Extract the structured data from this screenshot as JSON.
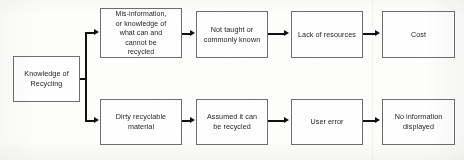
{
  "diagram": {
    "background_color": "#fdfdfc",
    "box_border_color": "#6e6e70",
    "connector_color": "#111111",
    "root": {
      "label": "Knowledge of\nRecycling"
    },
    "branches": [
      {
        "name": "upper-branch",
        "steps": [
          {
            "label": "Mis-information,\nor knowledge of\nwhat can and\ncannot be\nrecycled"
          },
          {
            "label": "Not taught or\ncommonly known"
          },
          {
            "label": "Lack of resources"
          },
          {
            "label": "Cost"
          }
        ]
      },
      {
        "name": "lower-branch",
        "steps": [
          {
            "label": "Dirty recyclable\nmaterial"
          },
          {
            "label": "Assumed it can\nbe recycled"
          },
          {
            "label": "User error"
          },
          {
            "label": "No information\ndisplayed"
          }
        ]
      }
    ]
  }
}
